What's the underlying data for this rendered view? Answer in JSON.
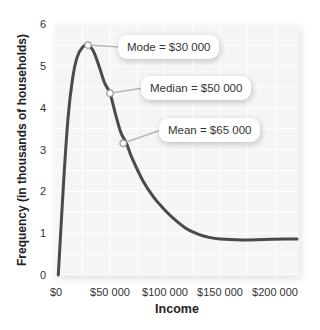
{
  "chart_data": {
    "type": "line",
    "title": "",
    "xlabel": "Income",
    "ylabel": "Frequency (in thousands of households)",
    "xlim": [
      0,
      220000
    ],
    "ylim": [
      0,
      6
    ],
    "grid": true,
    "x_tick_labels": [
      "$0",
      "$50 000",
      "$100 000",
      "$150 000",
      "$200 000"
    ],
    "x_ticks": [
      0,
      50000,
      100000,
      150000,
      200000
    ],
    "y_tick_labels": [
      "0",
      "1",
      "2",
      "3",
      "4",
      "5",
      "6"
    ],
    "y_ticks": [
      0,
      1,
      2,
      3,
      4,
      5,
      6
    ],
    "series": [
      {
        "name": "Income distribution",
        "color": "#4a4a4a",
        "x": [
          3000,
          8000,
          12000,
          16000,
          20000,
          25000,
          30000,
          35000,
          40000,
          45000,
          50000,
          55000,
          60000,
          65000,
          70000,
          80000,
          90000,
          100000,
          110000,
          120000,
          130000,
          140000,
          150000,
          170000,
          190000,
          210000,
          220000
        ],
        "y": [
          0,
          2.3,
          3.8,
          4.7,
          5.2,
          5.45,
          5.5,
          5.35,
          5.0,
          4.6,
          4.35,
          3.85,
          3.4,
          3.15,
          2.8,
          2.25,
          1.85,
          1.55,
          1.3,
          1.1,
          0.98,
          0.9,
          0.86,
          0.84,
          0.85,
          0.86,
          0.86
        ]
      }
    ],
    "annotations": [
      {
        "label": "Mode = $30 000",
        "x": 30000,
        "y": 5.5
      },
      {
        "label": "Median = $50 000",
        "x": 50000,
        "y": 4.35
      },
      {
        "label": "Mean = $65 000",
        "x": 62000,
        "y": 3.15
      }
    ]
  }
}
